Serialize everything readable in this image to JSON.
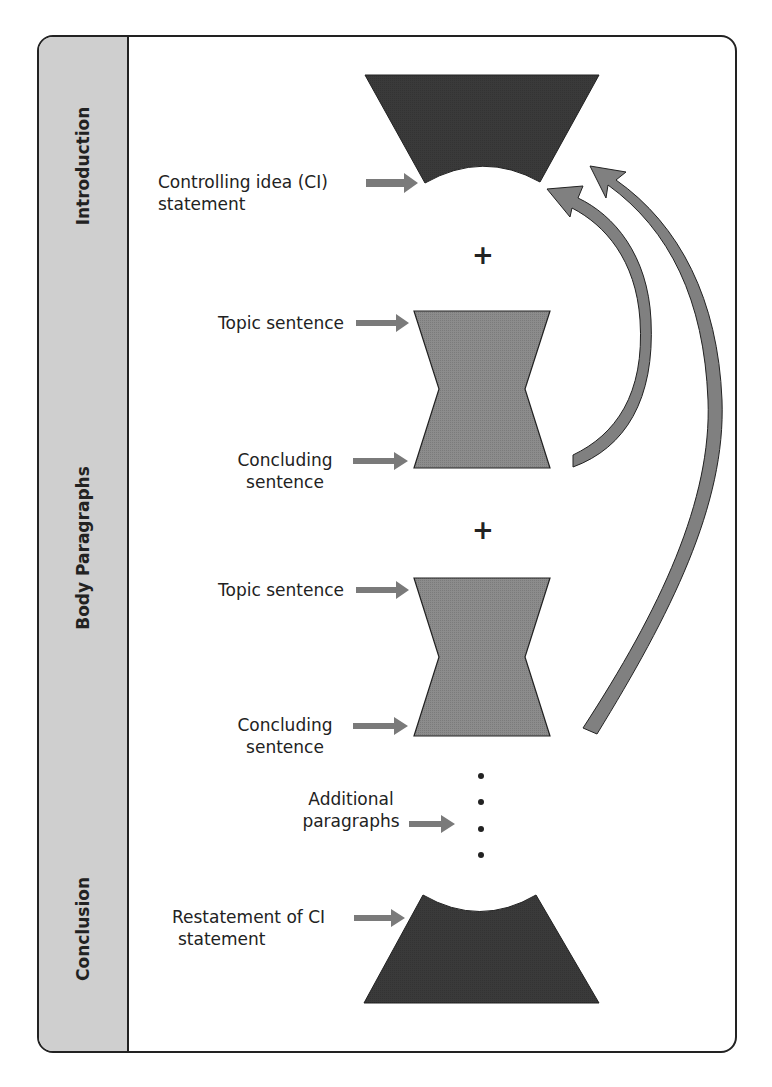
{
  "sections": [
    {
      "label": "Introduction"
    },
    {
      "label": "Body Paragraphs"
    },
    {
      "label": "Conclusion"
    }
  ],
  "labels": {
    "intro_ci_line1": "Controlling idea (CI)",
    "intro_ci_line2": "statement",
    "body1_topic": "Topic sentence",
    "body1_concluding_line1": "Concluding",
    "body1_concluding_line2": "sentence",
    "body2_topic": "Topic sentence",
    "body2_concluding_line1": "Concluding",
    "body2_concluding_line2": "sentence",
    "additional_line1": "Additional",
    "additional_line2": "paragraphs",
    "conclusion_line1": "Restatement of CI",
    "conclusion_line2": "statement"
  },
  "connectors": {
    "plus_1": "+",
    "plus_2": "+"
  },
  "colors": {
    "dark_shape": "#3a3a3a",
    "mid_shape": "#8c8c8c",
    "arrow_fill": "#808080",
    "sidebar": "#cfcfcf",
    "border": "#222222"
  }
}
